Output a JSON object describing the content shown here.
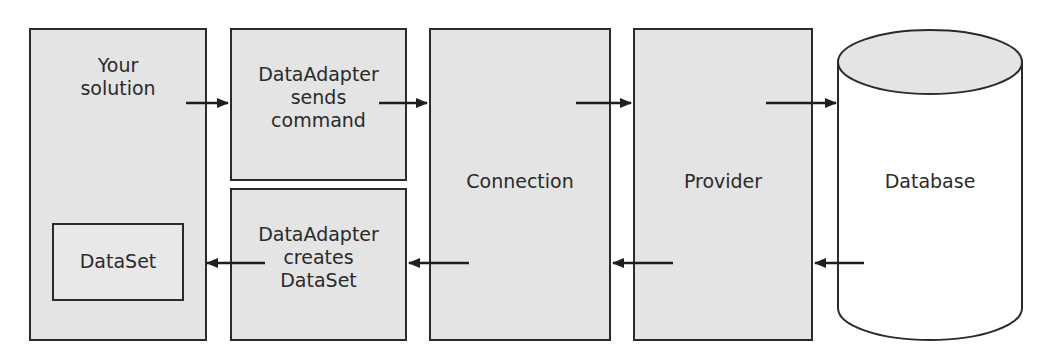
{
  "diagram": {
    "nodes": {
      "your_solution": {
        "label": "Your\nsolution"
      },
      "dataset": {
        "label": "DataSet"
      },
      "adapter_sends": {
        "label": "DataAdapter\nsends\ncommand"
      },
      "adapter_creates": {
        "label": "DataAdapter\ncreates\nDataSet"
      },
      "connection": {
        "label": "Connection"
      },
      "provider": {
        "label": "Provider"
      },
      "database": {
        "label": "Database"
      }
    },
    "edges": [
      {
        "from": "your_solution",
        "to": "adapter_sends",
        "direction": "right"
      },
      {
        "from": "adapter_sends",
        "to": "connection",
        "direction": "right"
      },
      {
        "from": "connection",
        "to": "provider",
        "direction": "right"
      },
      {
        "from": "provider",
        "to": "database",
        "direction": "right"
      },
      {
        "from": "database",
        "to": "provider",
        "direction": "left"
      },
      {
        "from": "provider",
        "to": "connection",
        "direction": "left"
      },
      {
        "from": "connection",
        "to": "adapter_creates",
        "direction": "left"
      },
      {
        "from": "adapter_creates",
        "to": "dataset",
        "direction": "left"
      }
    ],
    "colors": {
      "box_fill": "#e4e4e4",
      "stroke": "#2b2b2b",
      "text": "#2a2a2a",
      "database_body": "#ffffff"
    }
  }
}
